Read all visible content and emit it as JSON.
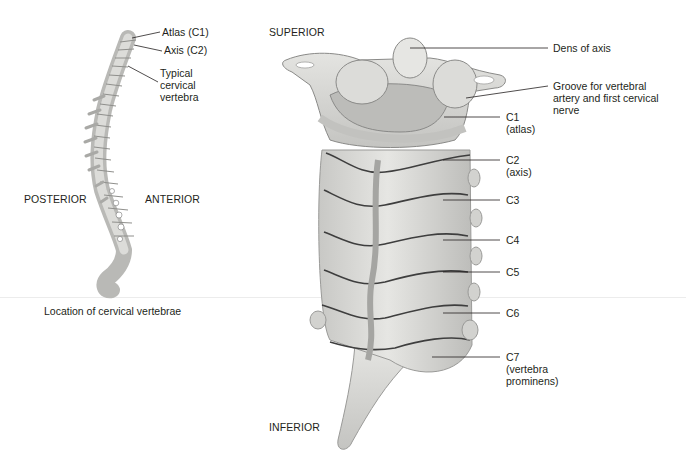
{
  "left_panel": {
    "caption": "Location of cervical vertebrae",
    "orientation": {
      "posterior": "POSTERIOR",
      "anterior": "ANTERIOR"
    },
    "labels": {
      "atlas": "Atlas (C1)",
      "axis": "Axis (C2)",
      "typical_1": "Typical",
      "typical_2": "cervical",
      "typical_3": "vertebra"
    }
  },
  "right_panel": {
    "orientation": {
      "superior": "SUPERIOR",
      "inferior": "INFERIOR"
    },
    "labels": {
      "dens": "Dens of axis",
      "groove_1": "Groove for vertebral",
      "groove_2": "artery and first cervical",
      "groove_3": "nerve",
      "c1_1": "C1",
      "c1_2": "(atlas)",
      "c2_1": "C2",
      "c2_2": "(axis)",
      "c3": "C3",
      "c4": "C4",
      "c5": "C5",
      "c6": "C6",
      "c7_1": "C7",
      "c7_2": "(vertebra",
      "c7_3": "prominens)"
    }
  },
  "colors": {
    "bone": "#d9d9d6",
    "bone_shadow": "#9a9a98",
    "bone_dark": "#4a4a4a",
    "leader": "#231f20"
  }
}
